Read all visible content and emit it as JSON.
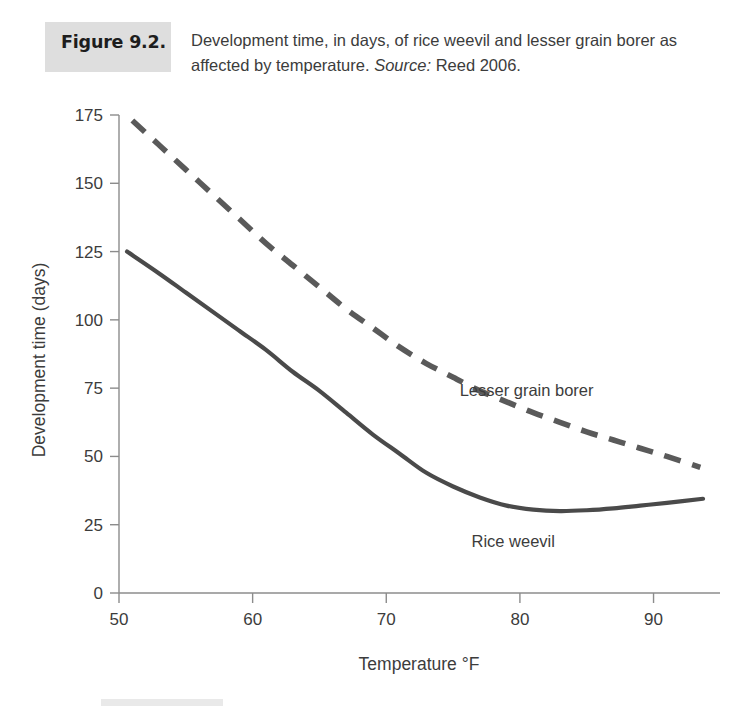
{
  "caption": {
    "figure_tag": "Figure 9.2.",
    "text": "Development time, in days, of rice weevil and lesser grain borer as affected by temperature.",
    "source_label": "Source:",
    "source_value": "Reed 2006."
  },
  "colors": {
    "figure_tag_background": "#dedede",
    "text": "#3c3c3c",
    "axis": "#8c8c8c",
    "rice_weevil_line": "#4a4a4a",
    "lesser_grain_borer_line": "#5a5a5a",
    "background": "#ffffff"
  },
  "chart_data": {
    "type": "line",
    "title": "Development time, in days, of rice weevil and lesser grain borer as affected by temperature.",
    "source": "Reed 2006.",
    "xlabel": "Temperature °F",
    "ylabel": "Development time (days)",
    "xlim": [
      50,
      94
    ],
    "ylim": [
      0,
      175
    ],
    "xticks": [
      50,
      60,
      70,
      80,
      90
    ],
    "yticks": [
      0,
      25,
      50,
      75,
      100,
      125,
      150,
      175
    ],
    "grid": false,
    "legend": "inline-annotations",
    "series": [
      {
        "name": "Lesser grain borer",
        "style": "dashed",
        "color": "#5a5a5a",
        "label_x": 80.5,
        "label_y": 72,
        "x": [
          51,
          53,
          55,
          57,
          59,
          61,
          63,
          65,
          67,
          69,
          71,
          73,
          75,
          77,
          79,
          81,
          83,
          85,
          87,
          89,
          91,
          93.5
        ],
        "y": [
          173,
          164,
          155,
          146,
          137,
          128,
          120,
          112,
          104,
          97,
          90,
          84,
          79,
          74,
          70,
          66,
          62.5,
          59,
          56,
          53,
          50,
          46
        ]
      },
      {
        "name": "Rice weevil",
        "style": "solid",
        "color": "#4a4a4a",
        "label_x": 79.5,
        "label_y": 17,
        "x": [
          50.6,
          53,
          55,
          57,
          59,
          61,
          63,
          65,
          67,
          69,
          71,
          73,
          75,
          77,
          79,
          81,
          83,
          85,
          87,
          89,
          91,
          93.7
        ],
        "y": [
          125,
          117,
          110,
          103,
          96,
          89,
          81,
          74,
          66,
          58,
          51,
          44,
          39,
          35,
          32,
          30.5,
          30,
          30.3,
          31,
          32,
          33,
          34.5
        ]
      }
    ]
  }
}
